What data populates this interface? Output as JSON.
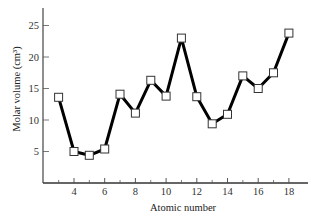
{
  "chart_data": {
    "type": "line",
    "title": "",
    "xlabel": "Atomic number",
    "ylabel": "Molar volume (cm³)",
    "x": [
      3,
      4,
      5,
      6,
      7,
      8,
      9,
      10,
      11,
      12,
      13,
      14,
      15,
      16,
      17,
      18
    ],
    "series": [
      {
        "name": "Molar volume",
        "values": [
          13.6,
          5.0,
          4.4,
          5.4,
          14.1,
          11.1,
          16.3,
          13.8,
          23.0,
          13.7,
          9.4,
          10.9,
          17.0,
          15.0,
          17.5,
          23.8
        ],
        "marker": "open-square",
        "color": "#000000"
      }
    ],
    "xticks": [
      4,
      6,
      8,
      10,
      12,
      14,
      16,
      18
    ],
    "xminor_ticks": [
      3,
      5,
      7,
      9,
      11,
      13,
      15,
      17
    ],
    "yticks": [
      5,
      10,
      15,
      20,
      25
    ],
    "xlim": [
      1.9,
      19.2
    ],
    "ylim": [
      0,
      28
    ],
    "grid": false,
    "legend": "none"
  },
  "axes": {
    "xlabel": "Atomic number",
    "ylabel": "Molar volume (cm³)",
    "xtick_labels": [
      "4",
      "6",
      "8",
      "10",
      "12",
      "14",
      "16",
      "18"
    ],
    "ytick_labels": [
      "5",
      "10",
      "15",
      "20",
      "25"
    ]
  }
}
